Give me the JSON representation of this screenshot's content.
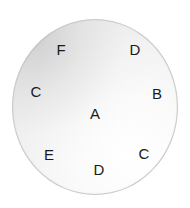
{
  "diagram": {
    "type": "lettered-circle",
    "background_color": "#ffffff",
    "disc": {
      "fill_light": "#ffffff",
      "fill_dark": "#dedede",
      "border_color": "#c9c9c9",
      "center_x": 95,
      "center_y": 107,
      "radius_x": 83,
      "radius_y": 88
    },
    "center_label": {
      "text": "A",
      "x": 95,
      "y": 114
    },
    "ring_labels": [
      {
        "text": "F",
        "x": 61,
        "y": 50
      },
      {
        "text": "D",
        "x": 135,
        "y": 50
      },
      {
        "text": "B",
        "x": 157,
        "y": 94
      },
      {
        "text": "C",
        "x": 144,
        "y": 154
      },
      {
        "text": "D",
        "x": 99,
        "y": 170
      },
      {
        "text": "E",
        "x": 49,
        "y": 155
      },
      {
        "text": "C",
        "x": 36,
        "y": 92
      }
    ]
  }
}
